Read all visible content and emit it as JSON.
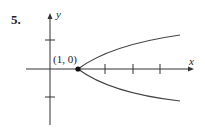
{
  "problem_number": "5.",
  "axes": {
    "x_label": "x",
    "y_label": "y"
  },
  "point": {
    "label": "(1, 0)",
    "x": 1,
    "y": 0
  },
  "curve": {
    "description": "parabola opening right with vertex at (1, 0)"
  },
  "colors": {
    "stroke": "#333333"
  }
}
